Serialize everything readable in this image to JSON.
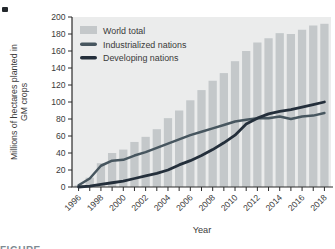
{
  "figure": {
    "x_axis_title": "Year",
    "y_axis_title": "Millions of hectares planted in GM crops",
    "caption_partial": "FIGURE"
  },
  "chart_data": {
    "type": "bar",
    "title": "",
    "xlabel": "Year",
    "ylabel": "Millions of hectares planted in GM crops",
    "ylim": [
      0,
      200
    ],
    "ytick_step": 20,
    "xtick_label_every": 2,
    "grid": false,
    "legend_position": "top-left",
    "plot_bg_color": "#ebecec",
    "axis_color": "#2b2b2b",
    "categories": [
      1996,
      1997,
      1998,
      1999,
      2000,
      2001,
      2002,
      2003,
      2004,
      2005,
      2006,
      2007,
      2008,
      2009,
      2010,
      2011,
      2012,
      2013,
      2014,
      2015,
      2016,
      2017,
      2018
    ],
    "bar_series": {
      "name": "World total",
      "color": "#c4c8ca",
      "values": [
        2,
        11,
        28,
        40,
        44,
        53,
        59,
        68,
        81,
        90,
        102,
        114,
        125,
        134,
        148,
        160,
        170,
        175,
        181,
        180,
        185,
        190,
        192
      ]
    },
    "line_series": [
      {
        "name": "Industrialized nations",
        "color": "#47565f",
        "values": [
          2,
          10,
          25,
          31,
          32,
          37,
          41,
          46,
          51,
          56,
          61,
          65,
          69,
          73,
          77,
          79,
          81,
          81,
          83,
          80,
          83,
          84,
          87
        ]
      },
      {
        "name": "Developing nations",
        "color": "#242f3b",
        "values": [
          0,
          1,
          3,
          5,
          7,
          10,
          13,
          16,
          20,
          26,
          31,
          37,
          44,
          52,
          61,
          74,
          81,
          86,
          89,
          91,
          94,
          97,
          100
        ]
      }
    ]
  }
}
